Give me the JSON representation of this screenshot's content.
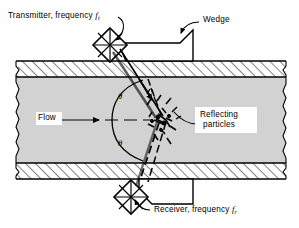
{
  "figure": {
    "type": "doppler-ultrasonic-flowmeter-cross-section",
    "colors": {
      "line": "#000000",
      "pipe_wall_fill": "#ffffff",
      "fluid_fill": "#d2d2d2",
      "background": "#ffffff"
    }
  },
  "labels": {
    "transmitter": {
      "text_before": "Transmitter, frequency ",
      "symbol": "f",
      "subscript": "t"
    },
    "wedge": {
      "text": "Wedge"
    },
    "flow": {
      "text": "Flow"
    },
    "reflecting_particles": {
      "line1": "Reflecting",
      "line2": "particles"
    },
    "receiver": {
      "text_before": "Receiver, frequency ",
      "symbol": "f",
      "subscript": "r"
    },
    "angle_upper": {
      "symbol": "θ"
    },
    "angle_lower": {
      "symbol": "θ"
    }
  },
  "geometry": {
    "pipe": {
      "top_wall_y1": 61,
      "top_wall_y2": 77,
      "bottom_wall_y1": 163,
      "bottom_wall_y2": 179,
      "left_x": 14,
      "right_x": 286
    },
    "centerline_y": 120,
    "transmitter_center": {
      "x": 110,
      "y": 44
    },
    "receiver_center": {
      "x": 131,
      "y": 196
    },
    "particle_cluster": {
      "x": 160,
      "y": 120
    }
  }
}
